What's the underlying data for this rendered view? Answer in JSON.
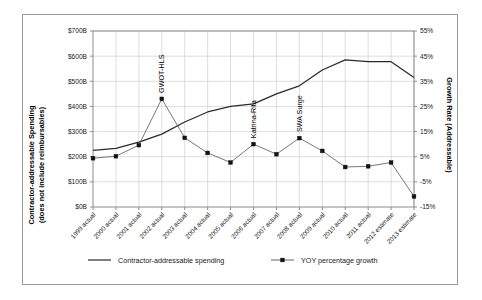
{
  "chart_data": {
    "type": "line",
    "title": "",
    "xlabel": "",
    "ylabel": "Contractor-addressable Spending (does not include reimbursables)",
    "y2label": "Growth Rate (Addressable)",
    "grid": true,
    "legend_position": "bottom",
    "categories": [
      "1999 actual",
      "2000 actual",
      "2001 actual",
      "2002 actual",
      "2003 actual",
      "2004 actual",
      "2005 actual",
      "2006 actual",
      "2007 actual",
      "2008 actual",
      "2009 actual",
      "2010 actual",
      "2011 actual",
      "2012 estimate",
      "2013 estimate"
    ],
    "ylim": [
      0,
      700
    ],
    "yticks": [
      "$0B",
      "$100B",
      "$200B",
      "$300B",
      "$400B",
      "$500B",
      "$600B",
      "$700B"
    ],
    "ytick_values": [
      0,
      100,
      200,
      300,
      400,
      500,
      600,
      700
    ],
    "y2lim": [
      -15,
      55
    ],
    "y2ticks": [
      "-15%",
      "-5%",
      "5%",
      "15%",
      "25%",
      "35%",
      "45%",
      "55%"
    ],
    "y2tick_values": [
      -15,
      -5,
      5,
      15,
      25,
      35,
      45,
      55
    ],
    "series": [
      {
        "name": "Contractor-addressable spending",
        "axis": "left",
        "units": "$B",
        "values": [
          225,
          233,
          258,
          290,
          338,
          378,
          400,
          410,
          450,
          482,
          545,
          585,
          578,
          578,
          515
        ]
      },
      {
        "name": "YOY percentage growth",
        "axis": "right",
        "units": "%",
        "values": [
          4.4,
          5.2,
          9.6,
          28.0,
          12.5,
          6.5,
          2.7,
          10.0,
          6.0,
          12.4,
          7.3,
          0.9,
          1.2,
          2.7,
          -10.8
        ]
      }
    ],
    "annotations": [
      {
        "label": "GWOT-HLS",
        "category": "2002 actual"
      },
      {
        "label": "Katrina-Rita",
        "category": "2006 actual"
      },
      {
        "label": "SWA Surge",
        "category": "2008 actual"
      }
    ]
  },
  "legend": {
    "items": [
      {
        "label": "Contractor-addressable spending",
        "marker": "line"
      },
      {
        "label": "YOY percentage growth",
        "marker": "line-square"
      }
    ]
  },
  "axis_titles": {
    "left_line1": "Contractor-addressable Spending",
    "left_line2": "(does not include reimbursables)",
    "right": "Growth Rate (Addressable)"
  }
}
